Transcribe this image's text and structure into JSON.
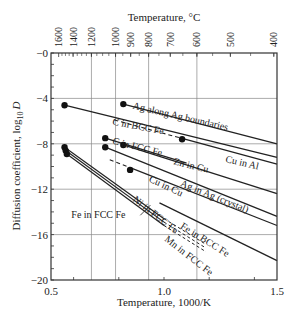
{
  "chart_data": {
    "type": "line",
    "title": "",
    "xlabel": "Temperature, 1000/K",
    "ylabel": "Diffusion coefficient, log10 D",
    "ylabel_main": "Diffusion coefficient, log",
    "ylabel_sub": "10",
    "ylabel_var": "D",
    "top_xlabel": "Temperature, °C",
    "xlim": [
      0.5,
      1.5
    ],
    "ylim": [
      -20,
      0
    ],
    "x_ticks": [
      0.5,
      1.0,
      1.5
    ],
    "x_tick_labels": [
      "0.5",
      "1.0",
      "1.5"
    ],
    "y_ticks": [
      0,
      -4,
      -8,
      -12,
      -16,
      -20
    ],
    "y_tick_labels": [
      "−0",
      "−4",
      "−8",
      "−12",
      "−16",
      "−20"
    ],
    "top_ticks_celsius": [
      1600,
      1400,
      1200,
      1000,
      900,
      800,
      700,
      600,
      500,
      400
    ],
    "top_tick_labels": [
      "1600",
      "1400",
      "1200",
      "1000",
      "900",
      "800",
      "700",
      "600",
      "500",
      "400"
    ],
    "grid": true,
    "series": [
      {
        "name": "Ag along Ag boundaries",
        "style": "solid",
        "points": [
          [
            0.82,
            -4.5
          ],
          [
            1.5,
            -8.0
          ]
        ],
        "dot": [
          0.82,
          -4.5
        ]
      },
      {
        "name": "C in BCC Fe",
        "style": "solid",
        "points": [
          [
            0.56,
            -4.6
          ],
          [
            1.5,
            -9.2
          ]
        ],
        "dot": [
          0.56,
          -4.6
        ]
      },
      {
        "name": "Cu in Al",
        "style": "dashed-solid",
        "points": [
          [
            0.78,
            -5.9
          ],
          [
            1.5,
            -9.8
          ]
        ],
        "dot": [
          1.08,
          -7.6
        ]
      },
      {
        "name": "C in FCC Fe",
        "style": "solid",
        "points": [
          [
            0.74,
            -7.5
          ],
          [
            1.1,
            -9.7
          ]
        ],
        "dot": [
          0.74,
          -7.5
        ]
      },
      {
        "name": "Zn in Cu",
        "style": "solid",
        "points": [
          [
            0.82,
            -8.1
          ],
          [
            1.5,
            -12.4
          ]
        ],
        "dot": [
          0.82,
          -8.1
        ]
      },
      {
        "name": "Cu in Cu",
        "style": "solid",
        "points": [
          [
            0.74,
            -8.3
          ],
          [
            1.5,
            -14.4
          ]
        ],
        "dot": [
          0.74,
          -8.3
        ]
      },
      {
        "name": "Ag in Ag (crystal)",
        "style": "dashed-solid",
        "points": [
          [
            0.76,
            -9.4
          ],
          [
            1.5,
            -15.2
          ]
        ],
        "dot": [
          0.85,
          -10.3
        ]
      },
      {
        "name": "Fe in BCC Fe",
        "style": "solid",
        "points": [
          [
            0.98,
            -13.2
          ],
          [
            1.5,
            -18.3
          ]
        ],
        "dot": null
      },
      {
        "name": "Ni in FCC Fe",
        "style": "solid-dashed",
        "points": [
          [
            0.56,
            -8.3
          ],
          [
            1.0,
            -14.6
          ]
        ],
        "dot": [
          0.56,
          -8.3
        ]
      },
      {
        "name": "Fe in FCC Fe",
        "style": "solid-dashed",
        "points": [
          [
            0.565,
            -8.6
          ],
          [
            1.0,
            -14.9
          ]
        ],
        "dot": [
          0.565,
          -8.6
        ]
      },
      {
        "name": "Mn in FCC Fe",
        "style": "solid-dashed",
        "points": [
          [
            0.57,
            -8.9
          ],
          [
            1.0,
            -15.2
          ]
        ],
        "dot": [
          0.57,
          -8.9
        ]
      }
    ],
    "annotations": [
      {
        "text": "Ag along Ag boundaries",
        "x": 0.86,
        "y": -4.9,
        "angle": 13
      },
      {
        "text": "C in BCC Fe",
        "x": 0.77,
        "y": -6.3,
        "angle": 11
      },
      {
        "text": "C in FCC Fe",
        "x": 0.77,
        "y": -8.0,
        "angle": 14
      },
      {
        "text": "Cu in Al",
        "x": 1.27,
        "y": -9.6,
        "angle": 13
      },
      {
        "text": "Zn in Cu",
        "x": 1.04,
        "y": -9.8,
        "angle": 14
      },
      {
        "text": "Cu in Cu",
        "x": 0.93,
        "y": -11.3,
        "angle": 25
      },
      {
        "text": "Ag in Ag (crystal)",
        "x": 1.07,
        "y": -11.7,
        "angle": 22
      },
      {
        "text": "Ni in FCC Fe",
        "x": 0.86,
        "y": -13.0,
        "angle": 38
      },
      {
        "text": "Fe in FCC Fe",
        "x": 0.59,
        "y": -14.5,
        "angle": 0
      },
      {
        "text": "Fe in BCC Fe",
        "x": 1.07,
        "y": -15.4,
        "angle": 32
      },
      {
        "text": "Mn in FCC Fe",
        "x": 1.0,
        "y": -16.5,
        "angle": 38
      }
    ]
  }
}
